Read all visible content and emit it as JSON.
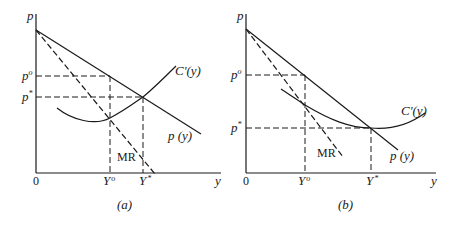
{
  "panels": [
    {
      "id": "a",
      "caption": "(a)",
      "axis": {
        "y_label": "p",
        "x_label": "y",
        "origin_label": "0"
      },
      "price_ticks": {
        "p_monopoly": "p",
        "p_monopoly_sup": "o",
        "p_competitive": "p",
        "p_competitive_sup": "*"
      },
      "quantity_ticks": {
        "y_monopoly": "Y",
        "y_monopoly_sup": "o",
        "y_competitive": "Y",
        "y_competitive_sup": "*"
      },
      "curves": {
        "demand": "p (y)",
        "marginal_cost": "C'(y)",
        "marginal_revenue": "MR"
      }
    },
    {
      "id": "b",
      "caption": "(b)",
      "axis": {
        "y_label": "p",
        "x_label": "y",
        "origin_label": "0"
      },
      "price_ticks": {
        "p_monopoly": "p",
        "p_monopoly_sup": "o",
        "p_competitive": "p",
        "p_competitive_sup": "*"
      },
      "quantity_ticks": {
        "y_monopoly": "Y",
        "y_monopoly_sup": "o",
        "y_competitive": "Y",
        "y_competitive_sup": "*"
      },
      "curves": {
        "demand": "p (y)",
        "marginal_cost": "C'(y)",
        "marginal_revenue": "MR"
      }
    }
  ],
  "colors": {
    "ink": "#1a1a1a",
    "background": "#ffffff"
  }
}
